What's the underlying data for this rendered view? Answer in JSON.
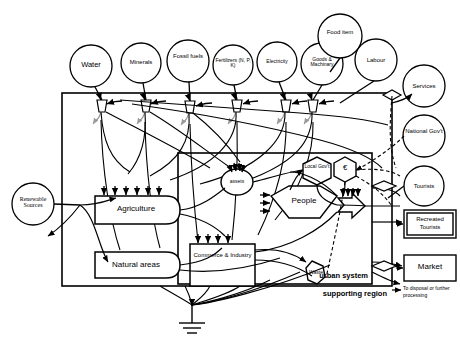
{
  "diagram": {
    "frames": [
      {
        "name": "supporting-region",
        "label": "supporting region"
      },
      {
        "name": "urban-system",
        "label": "urban system"
      }
    ],
    "source_circles": [
      {
        "id": "water",
        "label": "Water",
        "cx": 91,
        "cy": 66,
        "r": 21
      },
      {
        "id": "minerals",
        "label": "Minerals",
        "cx": 141,
        "cy": 63,
        "r": 20
      },
      {
        "id": "fossil-fuels",
        "label": "Fossil fuels",
        "cx": 188,
        "cy": 61,
        "r": 21
      },
      {
        "id": "fertilizers",
        "label": "Fertilizers (N, P, K)",
        "cx": 233,
        "cy": 65,
        "r": 20
      },
      {
        "id": "electricity",
        "label": "Electricity",
        "cx": 277,
        "cy": 62,
        "r": 20
      },
      {
        "id": "goods-machinary",
        "label": "Goods & Machinary",
        "cx": 322,
        "cy": 64,
        "r": 21
      },
      {
        "id": "food-item",
        "label": "Food item",
        "cx": 340,
        "cy": 36,
        "r": 22
      },
      {
        "id": "labour",
        "label": "Labour",
        "cx": 376,
        "cy": 60,
        "r": 21
      },
      {
        "id": "services",
        "label": "Services",
        "cx": 424,
        "cy": 86,
        "r": 21
      },
      {
        "id": "national-govt",
        "label": "National Gov't",
        "cx": 424,
        "cy": 136,
        "r": 21
      },
      {
        "id": "tourists",
        "label": "Tourists",
        "cx": 424,
        "cy": 186,
        "r": 20
      },
      {
        "id": "renewable-sources",
        "label": "Renewable Sources",
        "cx": 33,
        "cy": 204,
        "r": 21
      }
    ],
    "process_boxes": [
      {
        "id": "agriculture",
        "label": "Agriculture",
        "x": 95,
        "y": 196,
        "w": 85,
        "h": 28
      },
      {
        "id": "natural-areas",
        "label": "Natural areas",
        "x": 95,
        "y": 252,
        "w": 85,
        "h": 26
      },
      {
        "id": "commerce-industry",
        "label": "Commerce & Industry",
        "x": 190,
        "y": 244,
        "w": 65,
        "h": 42
      }
    ],
    "storages": [
      {
        "id": "assets",
        "label": "assets"
      },
      {
        "id": "people",
        "label": "People"
      },
      {
        "id": "local-govt",
        "label": "Local Gov't"
      },
      {
        "id": "euro",
        "label": "€"
      },
      {
        "id": "waste",
        "label": "Waste"
      }
    ],
    "sink_boxes": [
      {
        "id": "recreated-tourists",
        "label": "Recreated Tourists",
        "x": 404,
        "y": 210,
        "w": 52,
        "h": 28
      },
      {
        "id": "market",
        "label": "Market",
        "x": 404,
        "y": 255,
        "w": 52,
        "h": 26
      }
    ],
    "annotations": [
      {
        "id": "disposal-note",
        "label": "To disposal or further processing"
      }
    ]
  }
}
